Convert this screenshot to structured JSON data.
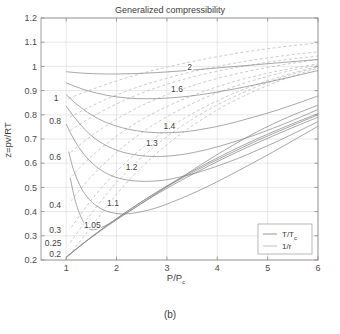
{
  "figure": {
    "caption": "(b)"
  },
  "chart_data": {
    "type": "line",
    "title": "Generalized compressibility",
    "xlabel": "P/P",
    "xlabel_sub": "c",
    "ylabel": "z=pv/RT",
    "xlim": [
      0.5,
      6
    ],
    "ylim": [
      0.2,
      1.2
    ],
    "grid": true,
    "xticks": [
      1,
      2,
      3,
      4,
      5,
      6
    ],
    "xticklabels": [
      "1",
      "2",
      "3",
      "4",
      "5",
      "6"
    ],
    "yticks": [
      0.2,
      0.3,
      0.4,
      0.5,
      0.6,
      0.7,
      0.8,
      0.9,
      1.0,
      1.1,
      1.2
    ],
    "yticklabels": [
      "0.2",
      "0.3",
      "0.4",
      "0.5",
      "0.6",
      "0.7",
      "0.8",
      "0.9",
      "1",
      "1.1",
      "1.2"
    ],
    "legend": {
      "position": "lower-right",
      "entries": [
        {
          "label": "T/T",
          "sub": "c",
          "style": "solid",
          "color": "#8a8a8a"
        },
        {
          "label": "1/r",
          "sub": "",
          "style": "solid",
          "color": "#b9b9b9"
        }
      ]
    },
    "series": [
      {
        "name": "T/Tc = 2",
        "label": "2",
        "label_x": 3.45,
        "label_y": 0.985,
        "style": "solid",
        "points": [
          [
            1.0,
            0.978
          ],
          [
            1.3,
            0.9725
          ],
          [
            1.6,
            0.9695
          ],
          [
            2.0,
            0.9685
          ],
          [
            2.4,
            0.9705
          ],
          [
            2.8,
            0.9745
          ],
          [
            3.2,
            0.98
          ],
          [
            3.6,
            0.9865
          ],
          [
            4.0,
            0.9935
          ],
          [
            4.4,
            1.0005
          ],
          [
            4.8,
            1.0075
          ],
          [
            5.2,
            1.0145
          ],
          [
            5.6,
            1.0215
          ],
          [
            6.0,
            1.0285
          ]
        ]
      },
      {
        "name": "T/Tc = 1.6",
        "label": "1.6",
        "label_x": 3.2,
        "label_y": 0.895,
        "style": "solid",
        "points": [
          [
            1.0,
            0.932
          ],
          [
            1.3,
            0.908
          ],
          [
            1.6,
            0.89
          ],
          [
            2.0,
            0.874
          ],
          [
            2.4,
            0.867
          ],
          [
            2.8,
            0.867
          ],
          [
            3.2,
            0.872
          ],
          [
            3.6,
            0.881
          ],
          [
            4.0,
            0.894
          ],
          [
            4.4,
            0.909
          ],
          [
            4.8,
            0.926
          ],
          [
            5.2,
            0.944
          ],
          [
            5.6,
            0.963
          ],
          [
            6.0,
            0.983
          ]
        ]
      },
      {
        "name": "T/Tc = 1.4",
        "label": "1.4",
        "label_x": 3.05,
        "label_y": 0.742,
        "style": "solid",
        "points": [
          [
            1.0,
            0.884
          ],
          [
            1.2,
            0.845
          ],
          [
            1.5,
            0.8
          ],
          [
            1.8,
            0.768
          ],
          [
            2.1,
            0.747
          ],
          [
            2.4,
            0.734
          ],
          [
            2.7,
            0.727
          ],
          [
            3.0,
            0.726
          ],
          [
            3.3,
            0.729
          ],
          [
            3.6,
            0.737
          ],
          [
            4.0,
            0.752
          ],
          [
            4.4,
            0.772
          ],
          [
            4.8,
            0.795
          ],
          [
            5.2,
            0.82
          ],
          [
            5.6,
            0.848
          ],
          [
            6.0,
            0.878
          ]
        ]
      },
      {
        "name": "T/Tc = 1.3",
        "label": "1.3",
        "label_x": 2.7,
        "label_y": 0.672,
        "style": "solid",
        "points": [
          [
            1.0,
            0.836
          ],
          [
            1.2,
            0.78
          ],
          [
            1.45,
            0.723
          ],
          [
            1.7,
            0.684
          ],
          [
            2.0,
            0.654
          ],
          [
            2.3,
            0.637
          ],
          [
            2.6,
            0.629
          ],
          [
            2.9,
            0.628
          ],
          [
            3.2,
            0.633
          ],
          [
            3.5,
            0.643
          ],
          [
            3.9,
            0.662
          ],
          [
            4.3,
            0.686
          ],
          [
            4.7,
            0.713
          ],
          [
            5.1,
            0.744
          ],
          [
            5.5,
            0.777
          ],
          [
            6.0,
            0.822
          ]
        ]
      },
      {
        "name": "T/Tc = 1.2",
        "label": "1.2",
        "label_x": 2.3,
        "label_y": 0.572,
        "style": "solid",
        "points": [
          [
            1.0,
            0.762
          ],
          [
            1.15,
            0.7
          ],
          [
            1.35,
            0.637
          ],
          [
            1.6,
            0.585
          ],
          [
            1.85,
            0.553
          ],
          [
            2.1,
            0.535
          ],
          [
            2.35,
            0.527
          ],
          [
            2.6,
            0.525
          ],
          [
            2.9,
            0.529
          ],
          [
            3.2,
            0.54
          ],
          [
            3.6,
            0.561
          ],
          [
            4.0,
            0.588
          ],
          [
            4.4,
            0.619
          ],
          [
            4.8,
            0.654
          ],
          [
            5.2,
            0.691
          ],
          [
            5.6,
            0.731
          ],
          [
            6.0,
            0.772
          ]
        ]
      },
      {
        "name": "T/Tc = 1.1",
        "label": "1.1",
        "label_x": 1.93,
        "label_y": 0.423,
        "style": "solid",
        "points": [
          [
            1.05,
            0.648
          ],
          [
            1.15,
            0.57
          ],
          [
            1.3,
            0.497
          ],
          [
            1.45,
            0.452
          ],
          [
            1.6,
            0.424
          ],
          [
            1.75,
            0.406
          ],
          [
            1.9,
            0.396
          ],
          [
            2.05,
            0.391
          ],
          [
            2.2,
            0.391
          ],
          [
            2.4,
            0.396
          ],
          [
            2.7,
            0.41
          ],
          [
            3.0,
            0.431
          ],
          [
            3.4,
            0.465
          ],
          [
            3.8,
            0.503
          ],
          [
            4.2,
            0.545
          ],
          [
            4.6,
            0.589
          ],
          [
            5.0,
            0.634
          ],
          [
            5.4,
            0.681
          ],
          [
            5.8,
            0.729
          ],
          [
            6.0,
            0.753
          ]
        ]
      },
      {
        "name": "T/Tc = 1.05",
        "label": "1.05",
        "label_x": 1.52,
        "label_y": 0.333,
        "style": "solid",
        "points": [
          [
            1.08,
            0.54
          ],
          [
            1.15,
            0.47
          ],
          [
            1.22,
            0.418
          ],
          [
            1.3,
            0.375
          ],
          [
            1.38,
            0.345
          ],
          [
            1.45,
            0.33
          ],
          [
            1.5,
            0.325
          ],
          [
            1.6,
            0.327
          ],
          [
            1.75,
            0.339
          ],
          [
            1.95,
            0.362
          ],
          [
            2.2,
            0.394
          ],
          [
            2.5,
            0.434
          ],
          [
            2.9,
            0.489
          ],
          [
            3.3,
            0.543
          ],
          [
            3.8,
            0.61
          ],
          [
            4.3,
            0.673
          ],
          [
            4.8,
            0.731
          ],
          [
            5.4,
            0.79
          ],
          [
            6.0,
            0.84
          ]
        ]
      },
      {
        "name": "T/Tc = 1.0 gas branch",
        "label": "",
        "label_x": 0,
        "label_y": 0,
        "style": "solid",
        "points": [
          [
            1.0,
            0.212
          ],
          [
            1.3,
            0.262
          ],
          [
            1.7,
            0.323
          ],
          [
            2.1,
            0.38
          ],
          [
            2.6,
            0.447
          ],
          [
            3.1,
            0.508
          ],
          [
            3.6,
            0.564
          ],
          [
            4.1,
            0.617
          ],
          [
            4.6,
            0.666
          ],
          [
            5.1,
            0.712
          ],
          [
            5.6,
            0.756
          ],
          [
            6.0,
            0.79
          ]
        ]
      },
      {
        "name": "T/Tc = 1.0 alt branch",
        "label": "",
        "label_x": 0,
        "label_y": 0,
        "style": "solid",
        "points": [
          [
            1.0,
            0.21
          ],
          [
            1.4,
            0.278
          ],
          [
            1.9,
            0.356
          ],
          [
            2.4,
            0.427
          ],
          [
            3.0,
            0.503
          ],
          [
            3.6,
            0.572
          ],
          [
            4.2,
            0.635
          ],
          [
            4.8,
            0.694
          ],
          [
            5.4,
            0.748
          ],
          [
            6.0,
            0.8
          ]
        ]
      },
      {
        "name": "T/Tc = 1.0 third branch",
        "label": "",
        "label_x": 0,
        "label_y": 0,
        "style": "solid",
        "points": [
          [
            1.02,
            0.216
          ],
          [
            1.5,
            0.295
          ],
          [
            2.0,
            0.371
          ],
          [
            2.6,
            0.455
          ],
          [
            3.2,
            0.531
          ],
          [
            3.8,
            0.6
          ],
          [
            4.4,
            0.663
          ],
          [
            5.0,
            0.72
          ],
          [
            5.6,
            0.772
          ],
          [
            6.0,
            0.805
          ]
        ]
      }
    ],
    "r_series": [
      {
        "name": "1/r = 1",
        "label": "1",
        "label_x": 0.8,
        "label_y": 0.855,
        "style": "dashed",
        "points": [
          [
            1.05,
            0.868
          ],
          [
            1.5,
            0.904
          ],
          [
            2.0,
            0.94
          ],
          [
            2.5,
            0.971
          ],
          [
            3.0,
            0.997
          ],
          [
            3.5,
            1.02
          ],
          [
            4.0,
            1.04
          ],
          [
            4.5,
            1.058
          ],
          [
            5.0,
            1.073
          ],
          [
            5.5,
            1.086
          ],
          [
            6.0,
            1.097
          ]
        ]
      },
      {
        "name": "1/r = 0.8",
        "label": "0.8",
        "label_x": 0.78,
        "label_y": 0.76,
        "style": "dashed",
        "points": [
          [
            1.07,
            0.79
          ],
          [
            1.5,
            0.836
          ],
          [
            2.0,
            0.882
          ],
          [
            2.5,
            0.92
          ],
          [
            3.0,
            0.951
          ],
          [
            3.5,
            0.978
          ],
          [
            4.0,
            1.0
          ],
          [
            4.5,
            1.019
          ],
          [
            5.0,
            1.035
          ],
          [
            5.5,
            1.049
          ],
          [
            6.0,
            1.06
          ]
        ]
      },
      {
        "name": "1/r = 0.7",
        "label": "",
        "label_x": 0,
        "label_y": 0,
        "style": "dashed",
        "points": [
          [
            1.08,
            0.735
          ],
          [
            1.5,
            0.79
          ],
          [
            2.0,
            0.845
          ],
          [
            2.5,
            0.89
          ],
          [
            3.0,
            0.926
          ],
          [
            3.5,
            0.956
          ],
          [
            4.0,
            0.98
          ],
          [
            4.5,
            1.0
          ],
          [
            5.0,
            1.017
          ],
          [
            5.5,
            1.031
          ],
          [
            6.0,
            1.043
          ]
        ]
      },
      {
        "name": "1/r = 0.6",
        "label": "0.6",
        "label_x": 0.78,
        "label_y": 0.615,
        "style": "dashed",
        "points": [
          [
            1.09,
            0.645
          ],
          [
            1.5,
            0.713
          ],
          [
            2.0,
            0.782
          ],
          [
            2.5,
            0.838
          ],
          [
            3.0,
            0.883
          ],
          [
            3.5,
            0.92
          ],
          [
            4.0,
            0.95
          ],
          [
            4.5,
            0.975
          ],
          [
            5.0,
            0.996
          ],
          [
            5.5,
            1.013
          ],
          [
            6.0,
            1.028
          ]
        ]
      },
      {
        "name": "1/r = 0.5",
        "label": "",
        "label_x": 0,
        "label_y": 0,
        "style": "dashed",
        "points": [
          [
            1.1,
            0.545
          ],
          [
            1.5,
            0.628
          ],
          [
            2.0,
            0.712
          ],
          [
            2.5,
            0.78
          ],
          [
            3.0,
            0.834
          ],
          [
            3.5,
            0.879
          ],
          [
            4.0,
            0.916
          ],
          [
            4.5,
            0.947
          ],
          [
            5.0,
            0.972
          ],
          [
            5.5,
            0.993
          ],
          [
            6.0,
            1.011
          ]
        ]
      },
      {
        "name": "1/r = 0.4",
        "label": "0.4",
        "label_x": 0.78,
        "label_y": 0.415,
        "style": "dashed",
        "points": [
          [
            1.1,
            0.445
          ],
          [
            1.5,
            0.545
          ],
          [
            2.0,
            0.645
          ],
          [
            2.5,
            0.726
          ],
          [
            3.0,
            0.792
          ],
          [
            3.5,
            0.846
          ],
          [
            4.0,
            0.891
          ],
          [
            4.5,
            0.928
          ],
          [
            5.0,
            0.959
          ],
          [
            5.5,
            0.985
          ],
          [
            6.0,
            1.006
          ]
        ]
      },
      {
        "name": "1/r = 0.3",
        "label": "0.3",
        "label_x": 0.78,
        "label_y": 0.313,
        "style": "dashed",
        "points": [
          [
            1.1,
            0.335
          ],
          [
            1.5,
            0.448
          ],
          [
            2.0,
            0.566
          ],
          [
            2.5,
            0.661
          ],
          [
            3.0,
            0.739
          ],
          [
            3.5,
            0.804
          ],
          [
            4.0,
            0.858
          ],
          [
            4.5,
            0.903
          ],
          [
            5.0,
            0.941
          ],
          [
            5.5,
            0.973
          ],
          [
            6.0,
            1.0
          ]
        ]
      },
      {
        "name": "1/r = 0.25",
        "label": "0.25",
        "label_x": 0.74,
        "label_y": 0.258,
        "style": "dashed",
        "points": [
          [
            1.08,
            0.272
          ],
          [
            1.5,
            0.392
          ],
          [
            2.0,
            0.52
          ],
          [
            2.5,
            0.624
          ],
          [
            3.0,
            0.71
          ],
          [
            3.5,
            0.781
          ],
          [
            4.0,
            0.841
          ],
          [
            4.5,
            0.891
          ],
          [
            5.0,
            0.933
          ],
          [
            5.5,
            0.968
          ],
          [
            6.0,
            0.998
          ]
        ]
      },
      {
        "name": "1/r = 0.2",
        "label": "0.2",
        "label_x": 0.78,
        "label_y": 0.212,
        "style": "dashed",
        "points": [
          [
            1.06,
            0.218
          ],
          [
            1.5,
            0.338
          ],
          [
            2.0,
            0.472
          ],
          [
            2.5,
            0.584
          ],
          [
            3.0,
            0.677
          ],
          [
            3.5,
            0.754
          ],
          [
            4.0,
            0.82
          ],
          [
            4.5,
            0.875
          ],
          [
            5.0,
            0.921
          ],
          [
            5.5,
            0.96
          ],
          [
            6.0,
            0.993
          ]
        ]
      }
    ]
  }
}
